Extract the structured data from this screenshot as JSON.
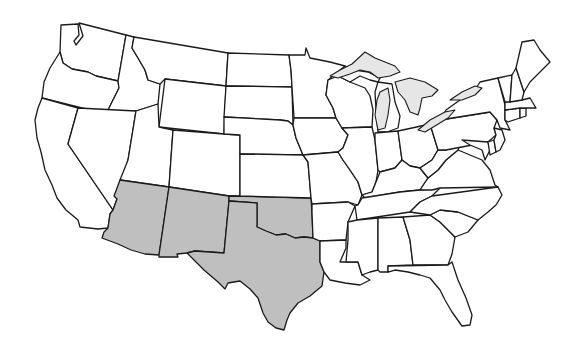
{
  "map": {
    "title": "",
    "subject": "United States - contiguous states",
    "highlighted_region": "Southwest",
    "highlighted_states": [
      "Arizona",
      "New Mexico",
      "Texas",
      "Oklahoma"
    ],
    "colors": {
      "highlight_fill": "#bfbfbf",
      "state_fill": "#ffffff",
      "lake_fill": "#e6e6e6",
      "border": "#1a1a1a",
      "background": "#ffffff"
    }
  }
}
